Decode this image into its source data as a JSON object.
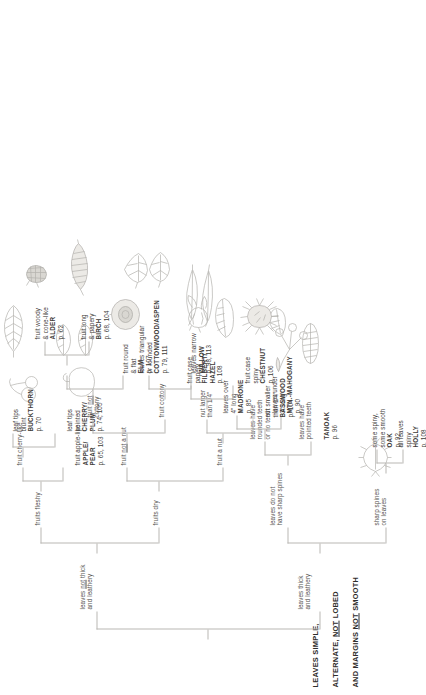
{
  "title": {
    "line1": "LEAVES SIMPLE,",
    "line2_a": "ALTERNATE, ",
    "line2_u": "NOT",
    "line2_b": " LOBED",
    "line3_a": "AND MARGINS ",
    "line3_u": "NOT",
    "line3_b": " SMOOTH"
  },
  "branches": {
    "thick_leathery": "leaves thick\nand leathery",
    "not_thick_a": "leaves ",
    "not_thick_u": "not",
    "not_thick_b": " thick\nand leathery",
    "sharp_spines": "sharp spines\non leaves",
    "no_sharp_spines": "leaves do not\nhave sharp spines",
    "pointed_teeth": "leaves have\npointed teeth",
    "rounded_teeth": "leaves have\nrounded teeth\nor no teeth",
    "fruits_fleshy": "fruits fleshy",
    "fruits_dry": "fruits dry",
    "fruit_cherry_like": "fruit cherry-like",
    "fruit_a_nut": "fruit a nut",
    "fruit_not_a_nut_a": "fruit ",
    "fruit_not_a_nut_u": "not",
    "fruit_not_a_nut_b": " a nut",
    "fruit_cottony": "fruit cottony",
    "fruit_not_cottony_a": "fruit ",
    "fruit_not_cottony_u": "not",
    "fruit_not_cottony_b": "\ncottony",
    "nut_larger": "nut  larger\nthan 1/4\"",
    "fruit_case_spiny": "fruit case\nspiny",
    "fruit_case_papery": "fruit case\npapery"
  },
  "terminals": {
    "holly": {
      "desc": "all leaves\nspiny",
      "name": "HOLLY",
      "page": "p. 108"
    },
    "oak": {
      "desc": "some spiny,\nsome smooth",
      "name": "OAK",
      "page": "p. 92"
    },
    "tanoak": {
      "desc": "",
      "name": "TANOAK",
      "page": "p. 96"
    },
    "mtnmah": {
      "desc": "leaves under\n3\" long",
      "name": "MTN.-MAHOGANY",
      "page": "p. 90"
    },
    "madrone": {
      "desc": "leaves over\n4\" long",
      "name": "MADRONE",
      "page": "p. 85"
    },
    "applepear": {
      "desc": "fruit apple-like",
      "name": "APPLE/\nPEAR",
      "page": "p. 65, 103"
    },
    "buckthorn": {
      "desc": "leaf tips\nblunt",
      "name": "BUCKTHORN",
      "page": "p. 70"
    },
    "cherryplum": {
      "desc": "leaf tips\npointed",
      "name": "CHERRY/\nPLUM",
      "page": "p. 74, 105"
    },
    "basswood": {
      "desc": "nut  smaller\nthan 1/4\"",
      "name": "BASSWOOD",
      "page": "p. 104"
    },
    "chestnut": {
      "desc": "",
      "name": "CHESTNUT",
      "page": "p. 106"
    },
    "filbert": {
      "desc": "",
      "name": "FILBERT/\nHAZEL",
      "page": "p. 108"
    },
    "elm": {
      "desc": "fruit round\n& flat",
      "name": "ELM",
      "page": "p. 107"
    },
    "birch": {
      "desc": "fruit long\n& papery",
      "name": "BIRCH",
      "page": "p. 68, 104"
    },
    "alder": {
      "desc": "fruit woody\n& cone-like",
      "name": "ALDER",
      "page": "p. 62"
    },
    "willow": {
      "desc": "leaves narrow",
      "name": "WILLOW",
      "page": "p. 98, 113"
    },
    "cottonwood": {
      "desc": "leaves triangular\nor rounded",
      "name": "COTTONWOOD/ASPEN",
      "page": "p. 79, 111"
    }
  },
  "icons": {
    "holly_leaf": "spiny-holly-leaf-drawing",
    "tanoak_leaf": "toothed-oval-leaf-drawing",
    "mahogany_leaf": "small-oval-leaf-drawing",
    "madrone_leaf": "large-oval-leaf-drawing",
    "apple_fruit": "apple-pear-fruit-drawing",
    "cherry_fruit": "cherry-cluster-drawing",
    "buckthorn_leaf": "veined-elliptic-leaf-drawing",
    "cherry_leaf": "pointed-leaf-pair-drawing",
    "basswood_fruit": "basswood-nutlet-cluster-drawing",
    "chestnut_burr": "spiny-chestnut-burr-drawing",
    "hazel_husk": "papery-hazel-husk-drawing",
    "elm_samara": "round-flat-elm-samara-drawing",
    "birch_catkin": "long-papery-birch-catkin-drawing",
    "alder_cone": "woody-alder-cone-drawing",
    "willow_leaves": "narrow-willow-leaves-drawing",
    "cottonwood_leaves": "triangular-cottonwood-leaves-drawing"
  }
}
